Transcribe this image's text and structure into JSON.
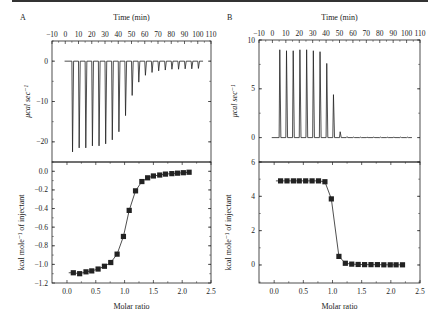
{
  "chart_data": [
    {
      "panel": "A",
      "type": "line",
      "subplot": "raw_thermogram",
      "title": "Time (min)",
      "xlabel": "Time (min)",
      "ylabel": "μcal sec⁻¹",
      "x_ticks": [
        -10,
        0,
        10,
        20,
        30,
        40,
        50,
        60,
        70,
        80,
        90,
        100,
        110
      ],
      "y_ticks": [
        0,
        -10,
        -20
      ],
      "xlim": [
        -10,
        110
      ],
      "ylim": [
        -25,
        5
      ],
      "baseline": 0,
      "injection_times": [
        5,
        10,
        15,
        20,
        25,
        30,
        35,
        40,
        45,
        50,
        55,
        60,
        65,
        70,
        75,
        80,
        85,
        90,
        95,
        100
      ],
      "peak_values": [
        -22.5,
        -21.5,
        -21.5,
        -21,
        -21,
        -20.5,
        -19.5,
        -17.5,
        -13.5,
        -8.5,
        -5.2,
        -3.5,
        -2.8,
        -2.4,
        -2.2,
        -2.0,
        -2.0,
        -1.9,
        -1.9,
        -1.8
      ]
    },
    {
      "panel": "A",
      "type": "line",
      "subplot": "integrated_heat",
      "xlabel": "Molar ratio",
      "ylabel": "kcal mole⁻¹ of injectant",
      "x_ticks": [
        0.0,
        0.5,
        1.0,
        1.5,
        2.0,
        2.5
      ],
      "y_ticks": [
        0.0,
        -0.2,
        -0.4,
        -0.6,
        -0.8,
        -1.0,
        -1.2
      ],
      "xlim": [
        -0.26,
        2.5
      ],
      "ylim": [
        -1.2,
        0.1
      ],
      "x": [
        0.11,
        0.22,
        0.33,
        0.43,
        0.54,
        0.65,
        0.76,
        0.87,
        0.98,
        1.08,
        1.19,
        1.3,
        1.4,
        1.5,
        1.61,
        1.71,
        1.82,
        1.92,
        2.02,
        2.12
      ],
      "y": [
        -1.09,
        -1.1,
        -1.08,
        -1.07,
        -1.05,
        -1.02,
        -0.98,
        -0.89,
        -0.7,
        -0.42,
        -0.21,
        -0.11,
        -0.07,
        -0.05,
        -0.04,
        -0.03,
        -0.025,
        -0.02,
        -0.015,
        -0.01
      ],
      "fit_line": true
    },
    {
      "panel": "B",
      "type": "line",
      "subplot": "raw_thermogram",
      "title": "Time (min)",
      "xlabel": "Time (min)",
      "ylabel": "μcal sec⁻¹",
      "x_ticks": [
        -10,
        0,
        10,
        20,
        30,
        40,
        50,
        60,
        70,
        80,
        90,
        100,
        110
      ],
      "y_ticks": [
        0,
        5,
        10
      ],
      "xlim": [
        -10,
        110
      ],
      "ylim": [
        -2.5,
        10
      ],
      "baseline": 0,
      "injection_times": [
        5,
        10,
        15,
        20,
        25,
        30,
        35,
        40,
        45,
        50,
        55,
        60,
        65,
        70,
        75,
        80,
        85,
        90,
        95,
        100
      ],
      "peak_values": [
        9.0,
        8.9,
        8.9,
        9.0,
        9.0,
        8.9,
        8.8,
        7.6,
        4.4,
        0.6,
        0.1,
        0.05,
        0.05,
        0.05,
        0.05,
        0.05,
        0.05,
        0.05,
        0.05,
        0.05
      ]
    },
    {
      "panel": "B",
      "type": "line",
      "subplot": "integrated_heat",
      "xlabel": "Molar ratio",
      "ylabel": "kcal mole⁻¹ of injectant",
      "x_ticks": [
        0.0,
        0.5,
        1.0,
        1.5,
        2.0,
        2.5
      ],
      "y_ticks": [
        0,
        2,
        4,
        6
      ],
      "xlim": [
        -0.26,
        2.5
      ],
      "ylim": [
        -1.05,
        6
      ],
      "x": [
        0.11,
        0.22,
        0.33,
        0.43,
        0.54,
        0.65,
        0.76,
        0.87,
        0.98,
        1.11,
        1.22,
        1.33,
        1.44,
        1.55,
        1.66,
        1.77,
        1.88,
        1.99,
        2.09,
        2.2
      ],
      "y": [
        4.9,
        4.9,
        4.9,
        4.9,
        4.9,
        4.9,
        4.9,
        4.85,
        3.85,
        0.5,
        0.1,
        0.05,
        0.03,
        0.02,
        0.02,
        0.02,
        0.01,
        0.01,
        0.01,
        0.01
      ],
      "fit_line": true
    }
  ],
  "labels": {
    "panel_a": "A",
    "panel_b": "B",
    "time_axis_title": "Time (min)",
    "molar_ratio_label": "Molar ratio",
    "raw_ylabel": "μcal sec⁻¹",
    "heat_ylabel": "kcal mole⁻¹ of injectant"
  },
  "colors": {
    "ink": "#222222",
    "rule": "#333333"
  }
}
